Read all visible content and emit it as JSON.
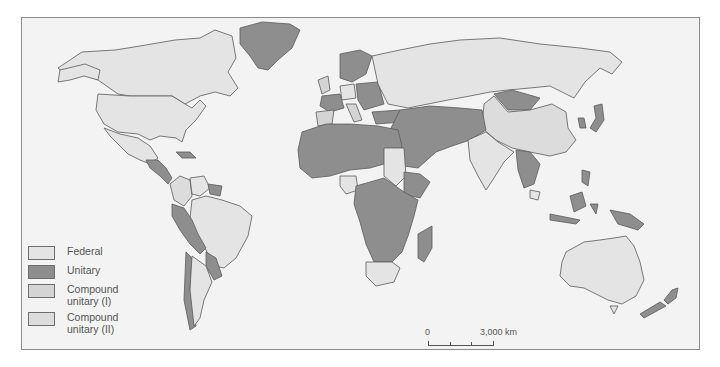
{
  "map": {
    "title": "",
    "colors": {
      "federal": "#e4e4e4",
      "unitary": "#8e8e8e",
      "compound_unitary_1": "#d4d4d4",
      "compound_unitary_2": "#dcdcdc",
      "water": "#f3f3f3",
      "border": "#5a5a5a"
    },
    "regions": {
      "federal": [
        "Canada",
        "United States",
        "Mexico",
        "Venezuela",
        "Brazil",
        "Argentina",
        "Nigeria",
        "Sudan",
        "South Africa",
        "Ethiopia",
        "Russia",
        "India",
        "Pakistan",
        "Malaysia",
        "Australia",
        "Germany",
        "Austria",
        "Switzerland",
        "Belgium",
        "Bosnia"
      ],
      "unitary": [
        "Greenland",
        "Central America",
        "Peru",
        "Bolivia",
        "Paraguay",
        "Uruguay",
        "Chile",
        "Guyana",
        "Suriname",
        "Africa (most countries)",
        "Madagascar",
        "Middle East",
        "Scandinavia",
        "France",
        "Central Europe",
        "Mongolia",
        "Japan",
        "Korea",
        "Southeast Asia",
        "Indonesia",
        "Papua New Guinea",
        "New Zealand"
      ],
      "compound_unitary_1": [
        "Spain",
        "Italy",
        "United Kingdom"
      ],
      "compound_unitary_2": [
        "China",
        "Colombia"
      ]
    }
  },
  "legend": {
    "items": [
      {
        "key": "federal",
        "label": "Federal"
      },
      {
        "key": "unitary",
        "label": "Unitary"
      },
      {
        "key": "compound_unitary_1",
        "label": "Compound unitary (I)"
      },
      {
        "key": "compound_unitary_2",
        "label": "Compound unitary (II)"
      }
    ]
  },
  "scale_bar": {
    "start_label": "0",
    "end_label": "3,000 km"
  }
}
